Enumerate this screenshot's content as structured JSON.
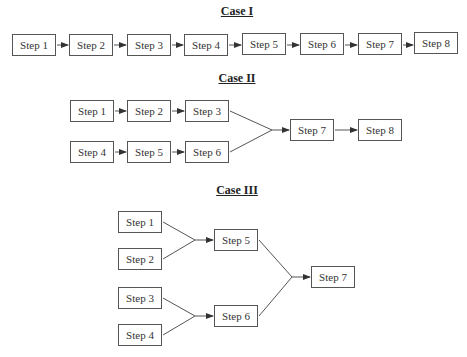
{
  "cases": [
    {
      "title": "Case I",
      "steps": [
        "Step 1",
        "Step 2",
        "Step 3",
        "Step 4",
        "Step 5",
        "Step 6",
        "Step 7",
        "Step 8"
      ]
    },
    {
      "title": "Case II",
      "steps": [
        "Step 1",
        "Step 2",
        "Step 3",
        "Step 4",
        "Step 5",
        "Step 6",
        "Step 7",
        "Step 8"
      ]
    },
    {
      "title": "Case III",
      "steps": [
        "Step 1",
        "Step 2",
        "Step 3",
        "Step 4",
        "Step 5",
        "Step 6",
        "Step 7"
      ]
    }
  ],
  "colors": {
    "line": "#555555",
    "text": "#333333"
  }
}
